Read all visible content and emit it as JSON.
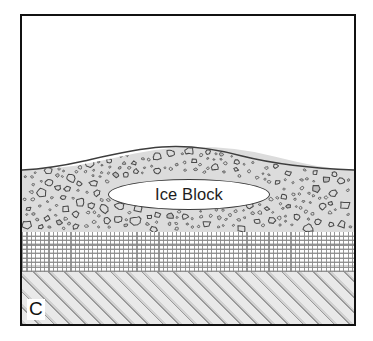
{
  "figure": {
    "panel_letter": "C",
    "border_color": "#111111",
    "background_color": "#ffffff"
  },
  "feature": {
    "label": "Ice Block",
    "fill_color": "#ffffff",
    "outline_color": "#3a3a3a",
    "shape": "ellipse"
  },
  "layers": [
    {
      "name": "air",
      "label": "",
      "pattern": "blank",
      "fill_color": "#ffffff"
    },
    {
      "name": "till",
      "label": "",
      "pattern": "pebble-clasts",
      "fill_color": "#dcdcdc",
      "clast_outline_color": "#4a4a4a"
    },
    {
      "name": "sand",
      "label": "",
      "pattern": "dotted-grid",
      "fill_color": "#ffffff",
      "grid_color": "#878787"
    },
    {
      "name": "bedrock",
      "label": "",
      "pattern": "diagonal-hatch",
      "fill_color": "#e9e9e9",
      "hatch_color": "#969696"
    }
  ]
}
